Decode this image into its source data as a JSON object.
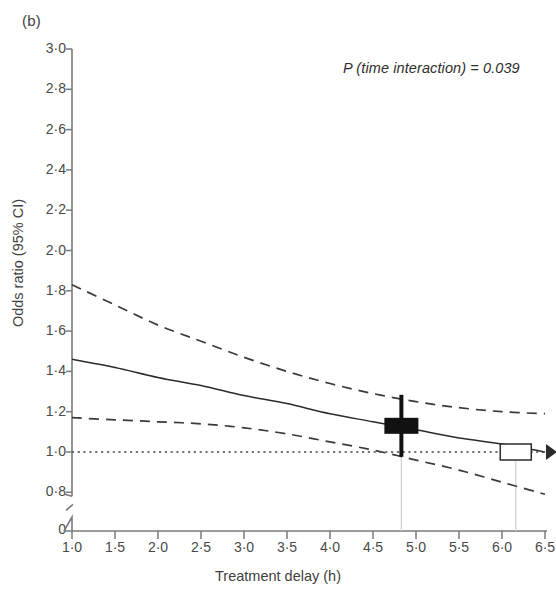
{
  "panel": {
    "label": "(b)"
  },
  "annotation": {
    "p_value_text": "P (time interaction) = 0.039"
  },
  "axes": {
    "y_title": "Odds ratio (95% CI)",
    "x_title": "Treatment delay (h)",
    "y_zero_label": "0"
  },
  "colors": {
    "axis": "#7a7a7a",
    "line": "#2b2b2b",
    "ci": "#3a3a3a",
    "reference": "#4a4a4a",
    "guide": "#cfcfcf",
    "marker_fill": "#111111",
    "marker_open_fill": "#ffffff",
    "text": "#3f3f3f"
  },
  "chart_data": {
    "type": "line",
    "title": "",
    "subtitle": "",
    "xlabel": "Treatment delay (h)",
    "ylabel": "Odds ratio (95% CI)",
    "xlim": [
      1.0,
      6.5
    ],
    "ylim": [
      0.7,
      3.0
    ],
    "grid": false,
    "legend_position": "none",
    "y_axis_break": true,
    "y_ticks": [
      0.8,
      1.0,
      1.2,
      1.4,
      1.6,
      1.8,
      2.0,
      2.2,
      2.4,
      2.6,
      2.8,
      3.0
    ],
    "y_tick_labels": [
      "0·8",
      "1·0",
      "1·2",
      "1·4",
      "1·6",
      "1·8",
      "2·0",
      "2·2",
      "2·4",
      "2·6",
      "2·8",
      "3·0"
    ],
    "x_ticks": [
      1.0,
      1.5,
      2.0,
      2.5,
      3.0,
      3.5,
      4.0,
      4.5,
      5.0,
      5.5,
      6.0,
      6.5
    ],
    "x_tick_labels": [
      "1·0",
      "1·5",
      "2·0",
      "2·5",
      "3·0",
      "3·5",
      "4·0",
      "4·5",
      "5·0",
      "5·5",
      "6·0",
      "6·5"
    ],
    "x": [
      1.0,
      1.5,
      2.0,
      2.5,
      3.0,
      3.5,
      4.0,
      4.5,
      5.0,
      5.5,
      6.0,
      6.5
    ],
    "series": [
      {
        "name": "Odds ratio (point estimate)",
        "style": "solid",
        "values": [
          1.46,
          1.42,
          1.37,
          1.33,
          1.28,
          1.24,
          1.19,
          1.15,
          1.11,
          1.07,
          1.04,
          1.0
        ]
      },
      {
        "name": "Upper 95% CI",
        "style": "dashed",
        "values": [
          1.83,
          1.73,
          1.63,
          1.55,
          1.47,
          1.4,
          1.34,
          1.29,
          1.25,
          1.22,
          1.2,
          1.19
        ]
      },
      {
        "name": "Lower 95% CI",
        "style": "dashed",
        "values": [
          1.17,
          1.16,
          1.15,
          1.14,
          1.12,
          1.09,
          1.05,
          1.01,
          0.96,
          0.91,
          0.85,
          0.79
        ]
      },
      {
        "name": "Reference (no effect)",
        "style": "dotted",
        "values": [
          1.0,
          1.0,
          1.0,
          1.0,
          1.0,
          1.0,
          1.0,
          1.0,
          1.0,
          1.0,
          1.0,
          1.0
        ]
      }
    ],
    "annotations": [
      {
        "text": "P (time interaction) = 0.039",
        "x": 5.0,
        "y": 2.85
      }
    ],
    "markers": [
      {
        "name": "filled-crossbar-marker",
        "x": 4.83,
        "y": 1.13,
        "fill": "solid",
        "guide_x": 4.83
      },
      {
        "name": "open-box-marker",
        "x": 6.16,
        "y": 1.0,
        "fill": "open",
        "guide_x": 6.16
      }
    ]
  }
}
